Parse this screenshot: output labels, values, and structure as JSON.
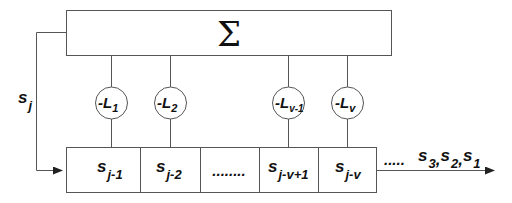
{
  "summer": {
    "symbol": "Σ"
  },
  "feedback": {
    "label": "s",
    "sub": "j"
  },
  "coefficients": [
    {
      "label": "-L",
      "sub": "1"
    },
    {
      "label": "-L",
      "sub": "2"
    },
    {
      "label": "-L",
      "sub": "v-1"
    },
    {
      "label": "-L",
      "sub": "v"
    }
  ],
  "register": [
    {
      "label": "s",
      "sub": "j-1"
    },
    {
      "label": "s",
      "sub": "j-2"
    },
    {
      "label": "........",
      "sub": ""
    },
    {
      "label": "s",
      "sub": "j-v+1"
    },
    {
      "label": "s",
      "sub": "j-v"
    }
  ],
  "output": {
    "dots": ".....",
    "items": [
      {
        "label": "s",
        "sub": "3",
        "sep": ","
      },
      {
        "label": "s",
        "sub": "2",
        "sep": ","
      },
      {
        "label": "s",
        "sub": "1",
        "sep": ""
      }
    ]
  }
}
